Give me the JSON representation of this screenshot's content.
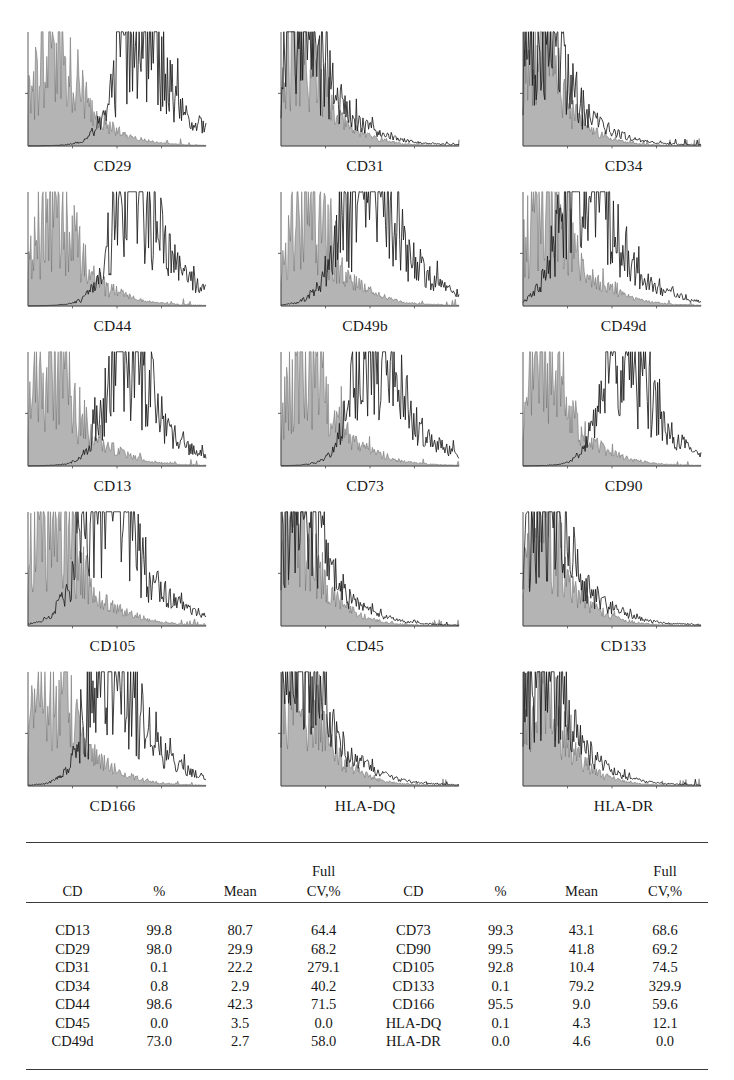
{
  "figure": {
    "type": "flow-cytometry-histogram-panel",
    "panel_columns": 3,
    "panel_rows": 5
  },
  "panels": [
    {
      "label": "CD29",
      "marker": "CD29",
      "pattern": "bimodal",
      "percent_positive": 98.0,
      "mean": 29.9,
      "cv": 68.2,
      "control_center": 0.14,
      "control_width": 0.105,
      "control_height": 0.74,
      "sample_center": 0.605,
      "sample_width": 0.105,
      "sample_height": 1.0,
      "sample_tail": 0.3,
      "seed": 11
    },
    {
      "label": "CD31",
      "marker": "CD31",
      "pattern": "negative",
      "percent_positive": 0.1,
      "mean": 22.2,
      "cv": 279.1,
      "control_center": 0.085,
      "control_width": 0.095,
      "control_height": 0.82,
      "sample_center": 0.105,
      "sample_width": 0.105,
      "sample_height": 0.93,
      "sample_tail": 0.42,
      "seed": 23
    },
    {
      "label": "CD34",
      "marker": "CD34",
      "pattern": "negative",
      "percent_positive": 0.8,
      "mean": 2.9,
      "cv": 40.2,
      "control_center": 0.075,
      "control_width": 0.09,
      "control_height": 0.8,
      "sample_center": 0.095,
      "sample_width": 0.1,
      "sample_height": 0.95,
      "sample_tail": 0.38,
      "seed": 37
    },
    {
      "label": "CD44",
      "marker": "CD44",
      "pattern": "bimodal",
      "percent_positive": 98.6,
      "mean": 42.3,
      "cv": 71.5,
      "control_center": 0.135,
      "control_width": 0.105,
      "control_height": 0.72,
      "sample_center": 0.585,
      "sample_width": 0.105,
      "sample_height": 1.0,
      "sample_tail": 0.3,
      "seed": 41
    },
    {
      "label": "CD49b",
      "marker": "CD49b",
      "pattern": "bimodal",
      "percent_positive": null,
      "mean": null,
      "cv": null,
      "control_center": 0.135,
      "control_width": 0.105,
      "control_height": 0.72,
      "sample_center": 0.47,
      "sample_width": 0.125,
      "sample_height": 0.98,
      "sample_tail": 0.33,
      "seed": 53
    },
    {
      "label": "CD49d",
      "marker": "CD49d",
      "pattern": "intermediate",
      "percent_positive": 73.0,
      "mean": 2.7,
      "cv": 58.0,
      "control_center": 0.125,
      "control_width": 0.11,
      "control_height": 0.76,
      "sample_center": 0.33,
      "sample_width": 0.115,
      "sample_height": 1.0,
      "sample_tail": 0.28,
      "seed": 67
    },
    {
      "label": "CD13",
      "marker": "CD13",
      "pattern": "bimodal",
      "percent_positive": 99.8,
      "mean": 80.7,
      "cv": 64.4,
      "control_center": 0.125,
      "control_width": 0.11,
      "control_height": 0.74,
      "sample_center": 0.545,
      "sample_width": 0.098,
      "sample_height": 1.0,
      "sample_tail": 0.28,
      "seed": 71
    },
    {
      "label": "CD73",
      "marker": "CD73",
      "pattern": "bimodal",
      "percent_positive": 99.3,
      "mean": 43.1,
      "cv": 68.6,
      "control_center": 0.12,
      "control_width": 0.11,
      "control_height": 0.76,
      "sample_center": 0.52,
      "sample_width": 0.105,
      "sample_height": 1.0,
      "sample_tail": 0.3,
      "seed": 83
    },
    {
      "label": "CD90",
      "marker": "CD90",
      "pattern": "bimodal",
      "percent_positive": 99.5,
      "mean": 41.8,
      "cv": 69.2,
      "control_center": 0.115,
      "control_width": 0.105,
      "control_height": 0.74,
      "sample_center": 0.56,
      "sample_width": 0.1,
      "sample_height": 1.0,
      "sample_tail": 0.28,
      "seed": 97
    },
    {
      "label": "CD105",
      "marker": "CD105",
      "pattern": "bimodal",
      "percent_positive": 92.8,
      "mean": 10.4,
      "cv": 74.5,
      "control_center": 0.125,
      "control_width": 0.115,
      "control_height": 0.78,
      "sample_center": 0.43,
      "sample_width": 0.125,
      "sample_height": 1.0,
      "sample_tail": 0.34,
      "seed": 103
    },
    {
      "label": "CD45",
      "marker": "CD45",
      "pattern": "negative",
      "percent_positive": 0.0,
      "mean": 3.5,
      "cv": 0.0,
      "control_center": 0.08,
      "control_width": 0.09,
      "control_height": 0.8,
      "sample_center": 0.1,
      "sample_width": 0.1,
      "sample_height": 0.95,
      "sample_tail": 0.36,
      "seed": 109
    },
    {
      "label": "CD133",
      "marker": "CD133",
      "pattern": "negative",
      "percent_positive": 0.1,
      "mean": 79.2,
      "cv": 329.9,
      "control_center": 0.085,
      "control_width": 0.095,
      "control_height": 0.82,
      "sample_center": 0.11,
      "sample_width": 0.105,
      "sample_height": 0.95,
      "sample_tail": 0.38,
      "seed": 127
    },
    {
      "label": "CD166",
      "marker": "CD166",
      "pattern": "bimodal",
      "percent_positive": 95.5,
      "mean": 9.0,
      "cv": 59.6,
      "control_center": 0.12,
      "control_width": 0.11,
      "control_height": 0.76,
      "sample_center": 0.46,
      "sample_width": 0.11,
      "sample_height": 1.0,
      "sample_tail": 0.3,
      "seed": 131
    },
    {
      "label": "HLA-DQ",
      "marker": "HLA-DQ",
      "pattern": "negative",
      "percent_positive": 0.1,
      "mean": 4.3,
      "cv": 12.1,
      "control_center": 0.085,
      "control_width": 0.095,
      "control_height": 0.82,
      "sample_center": 0.105,
      "sample_width": 0.105,
      "sample_height": 0.95,
      "sample_tail": 0.36,
      "seed": 139
    },
    {
      "label": "HLA-DR",
      "marker": "HLA-DR",
      "pattern": "negative",
      "percent_positive": 0.0,
      "mean": 4.6,
      "cv": 0.0,
      "control_center": 0.08,
      "control_width": 0.092,
      "control_height": 0.8,
      "sample_center": 0.1,
      "sample_width": 0.1,
      "sample_height": 0.95,
      "sample_tail": 0.34,
      "seed": 149
    }
  ],
  "table": {
    "headers_upper": [
      "",
      "",
      "",
      "Full",
      "",
      "",
      "",
      "Full"
    ],
    "headers_lower": [
      "CD",
      "%",
      "Mean",
      "CV,%",
      "CD",
      "%",
      "Mean",
      "CV,%"
    ],
    "rows": [
      [
        "CD13",
        "99.8",
        "80.7",
        "64.4",
        "CD73",
        "99.3",
        "43.1",
        "68.6"
      ],
      [
        "CD29",
        "98.0",
        "29.9",
        "68.2",
        "CD90",
        "99.5",
        "41.8",
        "69.2"
      ],
      [
        "CD31",
        "0.1",
        "22.2",
        "279.1",
        "CD105",
        "92.8",
        "10.4",
        "74.5"
      ],
      [
        "CD34",
        "0.8",
        "2.9",
        "40.2",
        "CD133",
        "0.1",
        "79.2",
        "329.9"
      ],
      [
        "CD44",
        "98.6",
        "42.3",
        "71.5",
        "CD166",
        "95.5",
        "9.0",
        "59.6"
      ],
      [
        "CD45",
        "0.0",
        "3.5",
        "0.0",
        "HLA-DQ",
        "0.1",
        "4.3",
        "12.1"
      ],
      [
        "CD49d",
        "73.0",
        "2.7",
        "58.0",
        "HLA-DR",
        "0.0",
        "4.6",
        "0.0"
      ]
    ]
  },
  "style": {
    "control_fill": "#b4b4b4",
    "control_stroke": "#6e6e6e",
    "sample_stroke": "#1c1c1c",
    "axis_color": "#4a4a4a",
    "rule_color": "#3a3a3a"
  },
  "chart_data": {
    "type": "histogram-grid",
    "title": "",
    "xlabel": "fluorescence intensity (log)",
    "ylabel": "cell count",
    "grid": false,
    "legend": null,
    "panel_order": [
      "CD29",
      "CD31",
      "CD34",
      "CD44",
      "CD49b",
      "CD49d",
      "CD13",
      "CD73",
      "CD90",
      "CD105",
      "CD45",
      "CD133",
      "CD166",
      "HLA-DQ",
      "HLA-DR"
    ],
    "series": [
      {
        "name": "isotype control",
        "render": "filled-gray"
      },
      {
        "name": "labeled sample",
        "render": "black-outline"
      }
    ],
    "table": {
      "type": "table",
      "columns": [
        "CD",
        "%",
        "Mean",
        "Full CV,%"
      ],
      "records": [
        {
          "CD": "CD13",
          "%": 99.8,
          "Mean": 80.7,
          "Full CV,%": 64.4
        },
        {
          "CD": "CD29",
          "%": 98.0,
          "Mean": 29.9,
          "Full CV,%": 68.2
        },
        {
          "CD": "CD31",
          "%": 0.1,
          "Mean": 22.2,
          "Full CV,%": 279.1
        },
        {
          "CD": "CD34",
          "%": 0.8,
          "Mean": 2.9,
          "Full CV,%": 40.2
        },
        {
          "CD": "CD44",
          "%": 98.6,
          "Mean": 42.3,
          "Full CV,%": 71.5
        },
        {
          "CD": "CD45",
          "%": 0.0,
          "Mean": 3.5,
          "Full CV,%": 0.0
        },
        {
          "CD": "CD49d",
          "%": 73.0,
          "Mean": 2.7,
          "Full CV,%": 58.0
        },
        {
          "CD": "CD73",
          "%": 99.3,
          "Mean": 43.1,
          "Full CV,%": 68.6
        },
        {
          "CD": "CD90",
          "%": 99.5,
          "Mean": 41.8,
          "Full CV,%": 69.2
        },
        {
          "CD": "CD105",
          "%": 92.8,
          "Mean": 10.4,
          "Full CV,%": 74.5
        },
        {
          "CD": "CD133",
          "%": 0.1,
          "Mean": 79.2,
          "Full CV,%": 329.9
        },
        {
          "CD": "CD166",
          "%": 95.5,
          "Mean": 9.0,
          "Full CV,%": 59.6
        },
        {
          "CD": "HLA-DQ",
          "%": 0.1,
          "Mean": 4.3,
          "Full CV,%": 12.1
        },
        {
          "CD": "HLA-DR",
          "%": 0.0,
          "Mean": 4.6,
          "Full CV,%": 0.0
        }
      ]
    }
  }
}
